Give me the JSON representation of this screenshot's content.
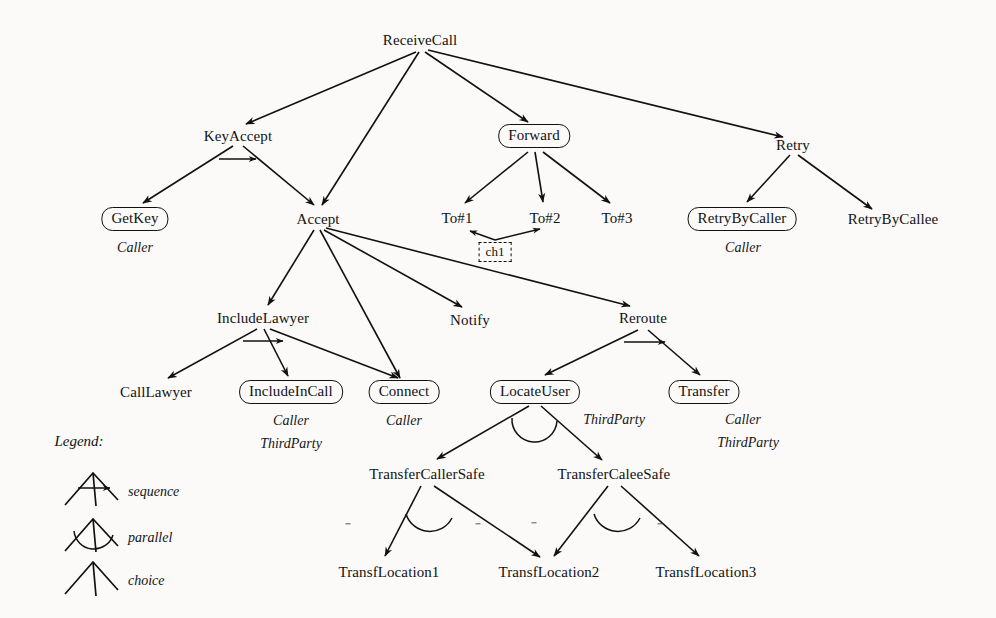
{
  "diagram": {
    "nodes": [
      {
        "id": "ReceiveCall",
        "label": "ReceiveCall",
        "x": 420,
        "y": 40,
        "boxed": false
      },
      {
        "id": "KeyAccept",
        "label": "KeyAccept",
        "x": 238,
        "y": 136,
        "boxed": false
      },
      {
        "id": "Forward",
        "label": "Forward",
        "x": 534,
        "y": 136,
        "boxed": true
      },
      {
        "id": "Retry",
        "label": "Retry",
        "x": 793,
        "y": 145,
        "boxed": false
      },
      {
        "id": "GetKey",
        "label": "GetKey",
        "x": 135,
        "y": 219,
        "boxed": true
      },
      {
        "id": "Accept",
        "label": "Accept",
        "x": 318,
        "y": 219,
        "boxed": false
      },
      {
        "id": "To#1",
        "label": "To#1",
        "x": 457,
        "y": 218,
        "boxed": false
      },
      {
        "id": "To#2",
        "label": "To#2",
        "x": 545,
        "y": 218,
        "boxed": false
      },
      {
        "id": "To#3",
        "label": "To#3",
        "x": 617,
        "y": 218,
        "boxed": false
      },
      {
        "id": "RetryByCaller",
        "label": "RetryByCaller",
        "x": 742,
        "y": 219,
        "boxed": true
      },
      {
        "id": "RetryByCallee",
        "label": "RetryByCallee",
        "x": 893,
        "y": 219,
        "boxed": false
      },
      {
        "id": "IncludeLawyer",
        "label": "IncludeLawyer",
        "x": 263,
        "y": 318,
        "boxed": false
      },
      {
        "id": "Notify",
        "label": "Notify",
        "x": 470,
        "y": 320,
        "boxed": false
      },
      {
        "id": "Reroute",
        "label": "Reroute",
        "x": 643,
        "y": 318,
        "boxed": false
      },
      {
        "id": "CallLawyer",
        "label": "CallLawyer",
        "x": 156,
        "y": 392,
        "boxed": false
      },
      {
        "id": "IncludeInCall",
        "label": "IncludeInCall",
        "x": 291,
        "y": 392,
        "boxed": true
      },
      {
        "id": "Connect",
        "label": "Connect",
        "x": 404,
        "y": 392,
        "boxed": true
      },
      {
        "id": "LocateUser",
        "label": "LocateUser",
        "x": 535,
        "y": 392,
        "boxed": true
      },
      {
        "id": "Transfer",
        "label": "Transfer",
        "x": 704,
        "y": 392,
        "boxed": true
      },
      {
        "id": "TransferCallerSafe",
        "label": "TransferCallerSafe",
        "x": 427,
        "y": 474,
        "boxed": false
      },
      {
        "id": "TransferCaleeSafe",
        "label": "TransferCaleeSafe",
        "x": 614,
        "y": 474,
        "boxed": false
      },
      {
        "id": "TransfLocation1",
        "label": "TransfLocation1",
        "x": 389,
        "y": 572,
        "boxed": false
      },
      {
        "id": "TransfLocation2",
        "label": "TransfLocation2",
        "x": 549,
        "y": 572,
        "boxed": false
      },
      {
        "id": "TransfLocation3",
        "label": "TransfLocation3",
        "x": 706,
        "y": 572,
        "boxed": false
      }
    ],
    "roles": [
      {
        "for": "GetKey",
        "text": "Caller",
        "x": 135,
        "y": 248
      },
      {
        "for": "RetryByCaller",
        "text": "Caller",
        "x": 743,
        "y": 248
      },
      {
        "for": "IncludeInCall",
        "text": "Caller",
        "x": 291,
        "y": 421
      },
      {
        "for": "IncludeInCall",
        "text": "ThirdParty",
        "x": 291,
        "y": 444
      },
      {
        "for": "Connect",
        "text": "Caller",
        "x": 404,
        "y": 421
      },
      {
        "for": "LocateUser",
        "text": "ThirdParty",
        "x": 614,
        "y": 420
      },
      {
        "for": "Transfer",
        "text": "Caller",
        "x": 743,
        "y": 420
      },
      {
        "for": "Transfer",
        "text": "ThirdParty",
        "x": 748,
        "y": 443
      }
    ],
    "channel": {
      "id": "ch1",
      "label": "ch1",
      "x": 495,
      "y": 252
    },
    "edges": [
      {
        "from": "ReceiveCall",
        "to": "KeyAccept"
      },
      {
        "from": "ReceiveCall",
        "to": "Accept"
      },
      {
        "from": "ReceiveCall",
        "to": "Forward"
      },
      {
        "from": "ReceiveCall",
        "to": "Retry"
      },
      {
        "from": "KeyAccept",
        "to": "GetKey"
      },
      {
        "from": "KeyAccept",
        "to": "Accept"
      },
      {
        "from": "Forward",
        "to": "To#1"
      },
      {
        "from": "Forward",
        "to": "To#2"
      },
      {
        "from": "Forward",
        "to": "To#3"
      },
      {
        "from": "Retry",
        "to": "RetryByCaller"
      },
      {
        "from": "Retry",
        "to": "RetryByCallee"
      },
      {
        "from": "Accept",
        "to": "IncludeLawyer"
      },
      {
        "from": "Accept",
        "to": "Connect"
      },
      {
        "from": "Accept",
        "to": "Notify"
      },
      {
        "from": "Accept",
        "to": "Reroute"
      },
      {
        "from": "IncludeLawyer",
        "to": "CallLawyer"
      },
      {
        "from": "IncludeLawyer",
        "to": "IncludeInCall"
      },
      {
        "from": "IncludeLawyer",
        "to": "Connect"
      },
      {
        "from": "Reroute",
        "to": "LocateUser"
      },
      {
        "from": "Reroute",
        "to": "Transfer"
      },
      {
        "from": "LocateUser",
        "to": "TransferCallerSafe"
      },
      {
        "from": "LocateUser",
        "to": "TransferCaleeSafe"
      },
      {
        "from": "TransferCallerSafe",
        "to": "TransfLocation1"
      },
      {
        "from": "TransferCallerSafe",
        "to": "TransfLocation2"
      },
      {
        "from": "TransferCaleeSafe",
        "to": "TransfLocation2"
      },
      {
        "from": "TransferCaleeSafe",
        "to": "TransfLocation3"
      }
    ],
    "operator_markers": [
      {
        "parent": "KeyAccept",
        "type": "sequence"
      },
      {
        "parent": "IncludeLawyer",
        "type": "sequence"
      },
      {
        "parent": "Reroute",
        "type": "sequence"
      },
      {
        "parent": "LocateUser",
        "type": "parallel"
      },
      {
        "parent": "TransferCallerSafe",
        "type": "parallel"
      },
      {
        "parent": "TransferCaleeSafe",
        "type": "parallel"
      }
    ]
  },
  "legend": {
    "title": "Legend:",
    "items": [
      {
        "symbol": "sequence",
        "label": "sequence"
      },
      {
        "symbol": "parallel",
        "label": "parallel"
      },
      {
        "symbol": "choice",
        "label": "choice"
      }
    ]
  }
}
